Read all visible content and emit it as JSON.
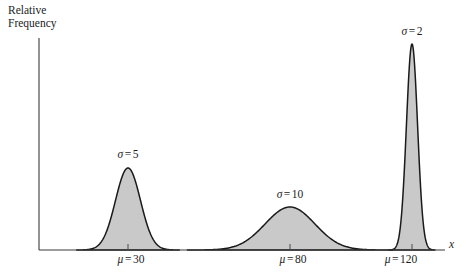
{
  "figure": {
    "background_color": "#ffffff",
    "axis_color": "#3a3a3a",
    "curve_stroke_color": "#1a1a1a",
    "curve_fill_color": "#c9c9c9"
  },
  "axes": {
    "y_axis_label_line1": "Relative",
    "y_axis_label_line2": "Frequency",
    "x_axis_label": "x",
    "x_axis_y_px": 250,
    "y_axis_x_px": 39,
    "y_axis_top_px": 38,
    "x_axis_right_px": 445
  },
  "chart_data": {
    "type": "line",
    "title": "",
    "subtitle": "",
    "xlabel": "x",
    "ylabel": "Relative Frequency",
    "grid": false,
    "legend": "none",
    "axis_ticks_shown": false,
    "series": [
      {
        "name": "curve-sigma-5",
        "mu": 30,
        "sigma": 5,
        "mu_label": "μ = 30",
        "sigma_label": "σ = 5",
        "peak_height_px": 82,
        "center_px": 128,
        "half_width_px": 38
      },
      {
        "name": "curve-sigma-10",
        "mu": 80,
        "sigma": 10,
        "mu_label": "μ = 80",
        "sigma_label": "σ = 10",
        "peak_height_px": 43,
        "center_px": 290,
        "half_width_px": 76
      },
      {
        "name": "curve-sigma-2",
        "mu": 120,
        "sigma": 2,
        "mu_label": "μ = 120",
        "sigma_label": "σ = 2",
        "peak_height_px": 206,
        "center_px": 412,
        "half_width_px": 17
      }
    ],
    "x": [
      30,
      80,
      120
    ],
    "values": [
      82,
      43,
      206
    ],
    "categories": [
      "μ = 30",
      "μ = 80",
      "μ = 120"
    ]
  },
  "annotations": {
    "sigma_labels": [
      {
        "text": "σ = 5",
        "sym": "σ",
        "eq": "=",
        "val": "5",
        "x_px": 128,
        "y_px": 148
      },
      {
        "text": "σ = 10",
        "sym": "σ",
        "eq": "=",
        "val": "10",
        "x_px": 290,
        "y_px": 188
      },
      {
        "text": "σ = 2",
        "sym": "σ",
        "eq": "=",
        "val": "2",
        "x_px": 412,
        "y_px": 25
      }
    ],
    "mu_labels": [
      {
        "text": "μ = 30",
        "sym": "μ",
        "eq": "=",
        "val": "30",
        "x_px": 131,
        "y_px": 253
      },
      {
        "text": "μ = 80",
        "sym": "μ",
        "eq": "=",
        "val": "80",
        "x_px": 293,
        "y_px": 253
      },
      {
        "text": "μ = 120",
        "sym": "μ",
        "eq": "=",
        "val": "120",
        "x_px": 401,
        "y_px": 253
      }
    ]
  }
}
